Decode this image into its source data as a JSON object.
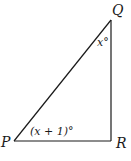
{
  "diagram": {
    "type": "right-triangle",
    "vertices": [
      {
        "name": "P",
        "label": "P",
        "x": 14,
        "y": 141
      },
      {
        "name": "Q",
        "label": "Q",
        "x": 111,
        "y": 20
      },
      {
        "name": "R",
        "label": "R",
        "x": 111,
        "y": 141
      }
    ],
    "angles": {
      "Q": {
        "label": "x°"
      },
      "P": {
        "label": "(x + 1)°"
      }
    },
    "colors": {
      "line": "#1a1a1a",
      "background": "#ffffff"
    }
  }
}
